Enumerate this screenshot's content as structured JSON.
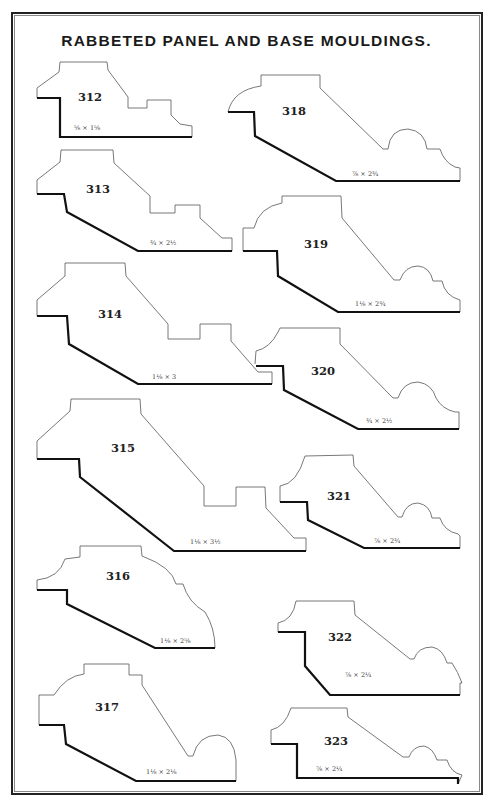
{
  "page": {
    "running_head": {
      "page_number": "",
      "title": ""
    },
    "title": "RABBETED PANEL AND BASE MOULDINGS."
  },
  "mouldings": [
    {
      "number": "312",
      "size": "⅝ × 1⅝"
    },
    {
      "number": "313",
      "size": "¾ × 2½"
    },
    {
      "number": "314",
      "size": "1⅛ × 3"
    },
    {
      "number": "315",
      "size": "1⅛ × 3½"
    },
    {
      "number": "316",
      "size": "1⅛ × 2⅝"
    },
    {
      "number": "317",
      "size": "1⅛ × 2⅛"
    },
    {
      "number": "318",
      "size": "⅞ × 2¾"
    },
    {
      "number": "319",
      "size": "1⅛ × 2¾"
    },
    {
      "number": "320",
      "size": "¾ × 2½"
    },
    {
      "number": "321",
      "size": "⅞ × 2¾"
    },
    {
      "number": "322",
      "size": "⅞ × 2¼"
    },
    {
      "number": "323",
      "size": "⅞ × 2¼"
    }
  ]
}
